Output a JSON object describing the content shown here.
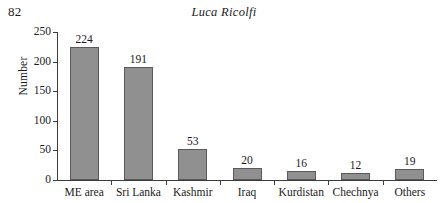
{
  "header": {
    "page_number": "82",
    "running_title": "Luca Ricolfi"
  },
  "chart_data": {
    "type": "bar",
    "title": "",
    "xlabel": "",
    "ylabel": "Number",
    "ylim": [
      0,
      250
    ],
    "yticks": [
      0,
      50,
      100,
      150,
      200,
      250
    ],
    "ytick_labels": [
      "0",
      "50",
      "100",
      "150",
      "200",
      "250"
    ],
    "grid": false,
    "legend": false,
    "value_labels": true,
    "bar_fill_color": "#909090",
    "bar_border_color": "#5a5a5a",
    "axis_color": "#3c3c3c",
    "categories": [
      "ME area",
      "Sri Lanka",
      "Kashmir",
      "Iraq",
      "Kurdistan",
      "Chechnya",
      "Others"
    ],
    "values": [
      224,
      191,
      53,
      20,
      16,
      12,
      19
    ],
    "value_text": [
      "224",
      "191",
      "53",
      "20",
      "16",
      "12",
      "19"
    ]
  }
}
